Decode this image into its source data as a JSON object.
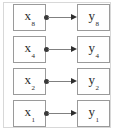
{
  "diagram": {
    "type": "bipartite-mapping",
    "colors": {
      "box_border": "#9a9a9a",
      "frame_border": "#d8d8d8",
      "line": "#808080",
      "arrow": "#2e2e2e",
      "dot": "#3a3a3a",
      "text": "#2a2a2a",
      "background": "#ffffff"
    },
    "rows": [
      {
        "source": {
          "base": "x",
          "subscript": "8"
        },
        "target": {
          "base": "y",
          "subscript": "8"
        }
      },
      {
        "source": {
          "base": "x",
          "subscript": "4"
        },
        "target": {
          "base": "y",
          "subscript": "4"
        }
      },
      {
        "source": {
          "base": "x",
          "subscript": "2"
        },
        "target": {
          "base": "y",
          "subscript": "2"
        }
      },
      {
        "source": {
          "base": "x",
          "subscript": "1"
        },
        "target": {
          "base": "y",
          "subscript": "1"
        }
      }
    ]
  }
}
